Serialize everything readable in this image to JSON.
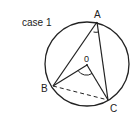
{
  "caption": "case  1",
  "labels": {
    "A": "A",
    "B": "B",
    "C": "C",
    "O": "0"
  }
}
